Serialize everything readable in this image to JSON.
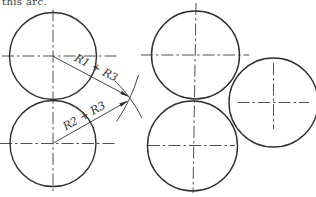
{
  "caption_fragment": "this arc.",
  "colors": {
    "background": "#ffffff",
    "ink": "#2f2f2f"
  },
  "diagram": {
    "width": 316,
    "height": 197,
    "circles": [
      {
        "name": "left-top-circle",
        "cx": 53,
        "cy": 56,
        "r": 43.5
      },
      {
        "name": "left-bottom-circle",
        "cx": 53,
        "cy": 143.5,
        "r": 43
      },
      {
        "name": "right-top-circle",
        "cx": 195.5,
        "cy": 55,
        "r": 44
      },
      {
        "name": "right-bottom-circle",
        "cx": 192.5,
        "cy": 146,
        "r": 45
      },
      {
        "name": "right-tangent-circle",
        "cx": 273.5,
        "cy": 102.5,
        "r": 44.5
      }
    ],
    "centerlines": [
      {
        "name": "left-top-horizontal-centerline",
        "x1": 2,
        "y1": 56,
        "x2": 117,
        "y2": 56
      },
      {
        "name": "left-vertical-centerline",
        "x1": 53,
        "y1": 9.5,
        "x2": 53,
        "y2": 192
      },
      {
        "name": "left-bottom-horizontal-centerline",
        "x1": 0,
        "y1": 143.5,
        "x2": 115,
        "y2": 143.5
      },
      {
        "name": "right-top-horizontal-centerline",
        "x1": 141,
        "y1": 55,
        "x2": 249.5,
        "y2": 55
      },
      {
        "name": "right-vertical-centerline",
        "x1": 196,
        "y1": 3,
        "x2": 193,
        "y2": 193
      },
      {
        "name": "right-bottom-horizontal-centerline",
        "x1": 148,
        "y1": 145.5,
        "x2": 235,
        "y2": 145.5
      },
      {
        "name": "tangent-circle-horizontal-centerline",
        "x1": 237.5,
        "y1": 102.5,
        "x2": 309,
        "y2": 102.5
      },
      {
        "name": "tangent-circle-vertical-centerline",
        "x1": 273.5,
        "y1": 63,
        "x2": 273.5,
        "y2": 129
      }
    ],
    "arrows": [
      {
        "name": "radius-arrow-r1-plus-r3",
        "x1": 53.5,
        "y1": 56.5,
        "x2": 129.5,
        "y2": 97,
        "label": "R1 + R3",
        "lx": 94.5,
        "ly": 71,
        "angle": 27.5
      },
      {
        "name": "radius-arrow-r2-plus-r3",
        "x1": 53.5,
        "y1": 143,
        "x2": 128.5,
        "y2": 100.5,
        "label": "R2 + R3",
        "lx": 86,
        "ly": 119,
        "angle": -29.5
      }
    ],
    "construction_arcs": [
      {
        "name": "compass-arc-from-bottom-center",
        "d": "M 114.5 80.5 Q 131.7 97.2 142 118"
      },
      {
        "name": "compass-arc-from-top-center",
        "d": "M 138.5 75 Q 131 100.2 116.5 121.5"
      }
    ]
  }
}
